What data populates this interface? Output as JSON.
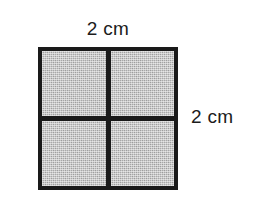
{
  "figure": {
    "title": "",
    "shape": "square",
    "subdivision": "2 by 2 grid",
    "cell_count": 4,
    "labels": {
      "top": "2 cm",
      "right": "2 cm"
    },
    "colors": {
      "background": "#ffffff",
      "outline": "#1a1a1a",
      "fill": "#a9a9a9",
      "text": "#1c1c1c"
    },
    "cells": [
      {
        "id": "top-left"
      },
      {
        "id": "top-right"
      },
      {
        "id": "bottom-left"
      },
      {
        "id": "bottom-right"
      }
    ]
  }
}
